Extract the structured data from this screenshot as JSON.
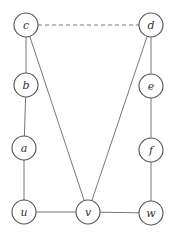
{
  "diagram": {
    "type": "graph",
    "nodes": [
      {
        "id": "c",
        "label": "c",
        "x": 26,
        "y": 25
      },
      {
        "id": "d",
        "label": "d",
        "x": 151,
        "y": 25
      },
      {
        "id": "b",
        "label": "b",
        "x": 26,
        "y": 85
      },
      {
        "id": "e",
        "label": "e",
        "x": 151,
        "y": 86
      },
      {
        "id": "a",
        "label": "a",
        "x": 24,
        "y": 148
      },
      {
        "id": "f",
        "label": "f",
        "x": 151,
        "y": 150
      },
      {
        "id": "u",
        "label": "u",
        "x": 24,
        "y": 212
      },
      {
        "id": "v",
        "label": "v",
        "x": 88,
        "y": 212
      },
      {
        "id": "w",
        "label": "w",
        "x": 151,
        "y": 213
      }
    ],
    "edges": [
      {
        "from": "c",
        "to": "d",
        "style": "dashed"
      },
      {
        "from": "c",
        "to": "b",
        "style": "solid"
      },
      {
        "from": "b",
        "to": "a",
        "style": "solid"
      },
      {
        "from": "a",
        "to": "u",
        "style": "solid"
      },
      {
        "from": "u",
        "to": "v",
        "style": "solid"
      },
      {
        "from": "v",
        "to": "w",
        "style": "solid"
      },
      {
        "from": "d",
        "to": "e",
        "style": "solid"
      },
      {
        "from": "e",
        "to": "f",
        "style": "solid"
      },
      {
        "from": "f",
        "to": "w",
        "style": "solid"
      },
      {
        "from": "c",
        "to": "v",
        "style": "solid"
      },
      {
        "from": "d",
        "to": "v",
        "style": "solid"
      }
    ]
  }
}
